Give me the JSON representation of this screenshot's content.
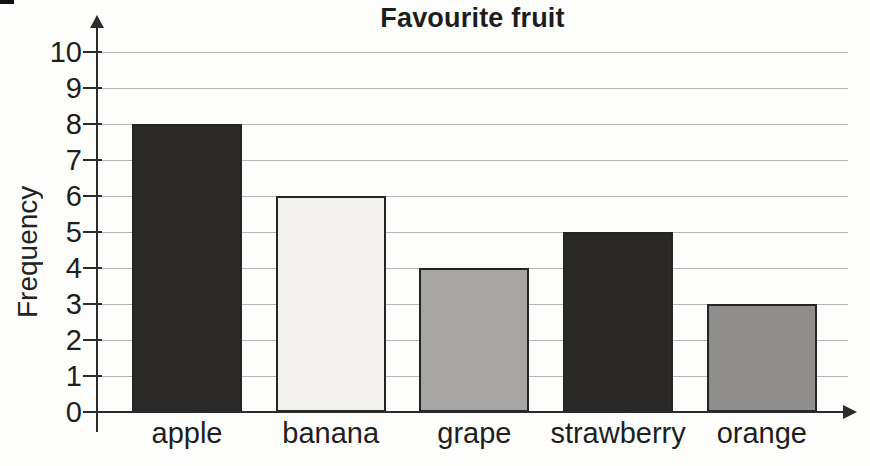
{
  "page": {
    "background": "#fdfdfc",
    "corner_mark_color": "#111111"
  },
  "chart_data": {
    "type": "bar",
    "title": "Favourite fruit",
    "xlabel": "",
    "ylabel": "Frequency",
    "categories": [
      "apple",
      "banana",
      "grape",
      "strawberry",
      "orange"
    ],
    "values": [
      8,
      6,
      4,
      5,
      3
    ],
    "bar_colors": [
      "#2b2a29",
      "#f2f1ee",
      "#a6a5a3",
      "#2a2928",
      "#8f8e8c"
    ],
    "bar_border_color": "#242424",
    "ylim": [
      0,
      10
    ],
    "ytick_step": 1,
    "yticks": [
      0,
      1,
      2,
      3,
      4,
      5,
      6,
      7,
      8,
      9,
      10
    ],
    "grid": "horizontal gridlines at every integer",
    "gridline_color": "#b5b5b5",
    "axis_color": "#2b2b2b",
    "text_color": "#1e1e1e",
    "legend": "none"
  }
}
